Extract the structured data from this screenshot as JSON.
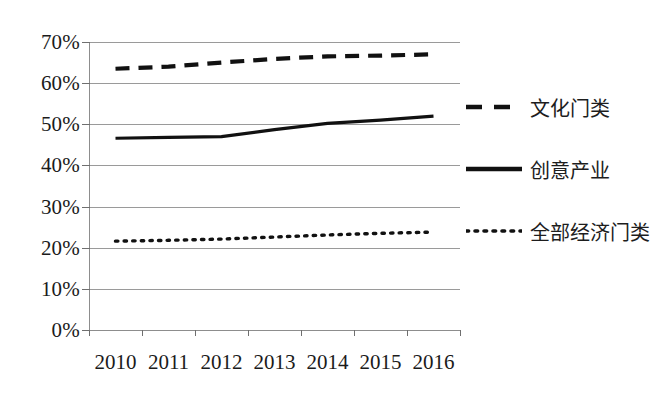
{
  "chart_data": {
    "type": "line",
    "title": "",
    "xlabel": "",
    "ylabel": "",
    "categories": [
      "2010",
      "2011",
      "2012",
      "2013",
      "2014",
      "2015",
      "2016"
    ],
    "ylim": [
      0,
      70
    ],
    "ytick_labels": [
      "0%",
      "10%",
      "20%",
      "30%",
      "40%",
      "50%",
      "60%",
      "70%"
    ],
    "ytick_values": [
      0,
      10,
      20,
      30,
      40,
      50,
      60,
      70
    ],
    "grid": true,
    "legend_position": "right",
    "series": [
      {
        "name": "文化门类",
        "style": "dashed",
        "color": "#111111",
        "values": [
          63.5,
          64.0,
          65.0,
          65.9,
          66.5,
          66.7,
          67.0
        ]
      },
      {
        "name": "创意产业",
        "style": "solid",
        "color": "#111111",
        "values": [
          46.6,
          46.8,
          47.0,
          48.7,
          50.2,
          51.0,
          52.0
        ]
      },
      {
        "name": "全部经济门类",
        "style": "dotted",
        "color": "#111111",
        "values": [
          21.6,
          21.8,
          22.1,
          22.6,
          23.1,
          23.5,
          23.8
        ]
      }
    ]
  }
}
